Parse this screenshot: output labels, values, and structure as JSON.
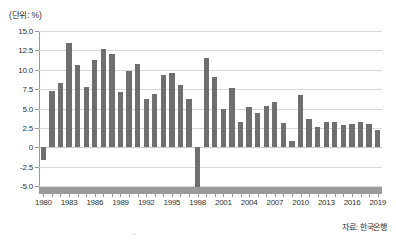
{
  "unit_label": "(단위: %)",
  "source_note": "자료: 한국은행",
  "page_marker": ".",
  "colors": {
    "bar": "#6f6f6f",
    "grid": "#d8d8d8",
    "axis": "#9a9a9a",
    "text": "#333333",
    "background": "#ffffff"
  },
  "chart_data": {
    "type": "bar",
    "title": "",
    "subtitle": "",
    "xlabel": "",
    "ylabel": "",
    "unit": "%",
    "ylim": [
      -5.0,
      15.0
    ],
    "ytick_labels": [
      "15.0",
      "12.5",
      "10.0",
      "7.5",
      "5.0",
      "2.5",
      "0",
      "-2.5",
      "-5.0"
    ],
    "ytick_values": [
      15.0,
      12.5,
      10.0,
      7.5,
      5.0,
      2.5,
      0,
      -2.5,
      -5.0
    ],
    "grid": true,
    "legend": null,
    "xtick_labels": [
      "1980",
      "1983",
      "1986",
      "1989",
      "1992",
      "1995",
      "1998",
      "2001",
      "2004",
      "2007",
      "2010",
      "2013",
      "2016",
      "2019"
    ],
    "categories": [
      "1980",
      "1981",
      "1982",
      "1983",
      "1984",
      "1985",
      "1986",
      "1987",
      "1988",
      "1989",
      "1990",
      "1991",
      "1992",
      "1993",
      "1994",
      "1995",
      "1996",
      "1997",
      "1998",
      "1999",
      "2000",
      "2001",
      "2002",
      "2003",
      "2004",
      "2005",
      "2006",
      "2007",
      "2008",
      "2009",
      "2010",
      "2011",
      "2012",
      "2013",
      "2014",
      "2015",
      "2016",
      "2017",
      "2018",
      "2019"
    ],
    "values": [
      -1.6,
      7.2,
      8.3,
      13.4,
      10.6,
      7.8,
      11.3,
      12.7,
      12.0,
      7.1,
      9.9,
      10.8,
      6.2,
      6.9,
      9.3,
      9.6,
      8.0,
      6.2,
      -5.1,
      11.5,
      9.1,
      5.0,
      7.7,
      3.2,
      5.2,
      4.4,
      5.3,
      5.8,
      3.1,
      0.8,
      6.8,
      3.7,
      2.6,
      3.2,
      3.2,
      2.9,
      3.0,
      3.2,
      3.0,
      2.2
    ]
  }
}
